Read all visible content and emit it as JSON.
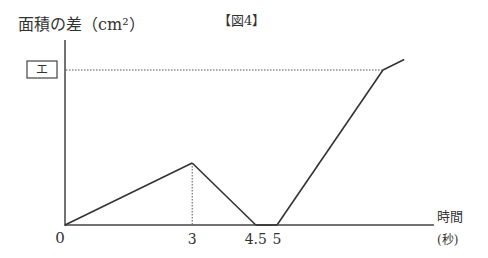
{
  "chart_data": {
    "type": "line",
    "title": "【図4】",
    "ylabel": "面積の差（cm²）",
    "xlabel_top": "時間",
    "xlabel_unit": "(秒)",
    "origin_label": "0",
    "y_marker_label": "エ",
    "x_ticks": [
      {
        "value": 3,
        "label": "3"
      },
      {
        "value": 4.5,
        "label": "4.5"
      },
      {
        "value": 5,
        "label": "5"
      }
    ],
    "points": [
      [
        0,
        0
      ],
      [
        3,
        1
      ],
      [
        4.5,
        0
      ],
      [
        5,
        0
      ],
      [
        7.5,
        2.5
      ],
      [
        8,
        2.67
      ]
    ],
    "guide_x": 3,
    "guide_y": 2.5,
    "xlim": [
      0,
      10
    ],
    "ylim": [
      0,
      3.2
    ]
  }
}
